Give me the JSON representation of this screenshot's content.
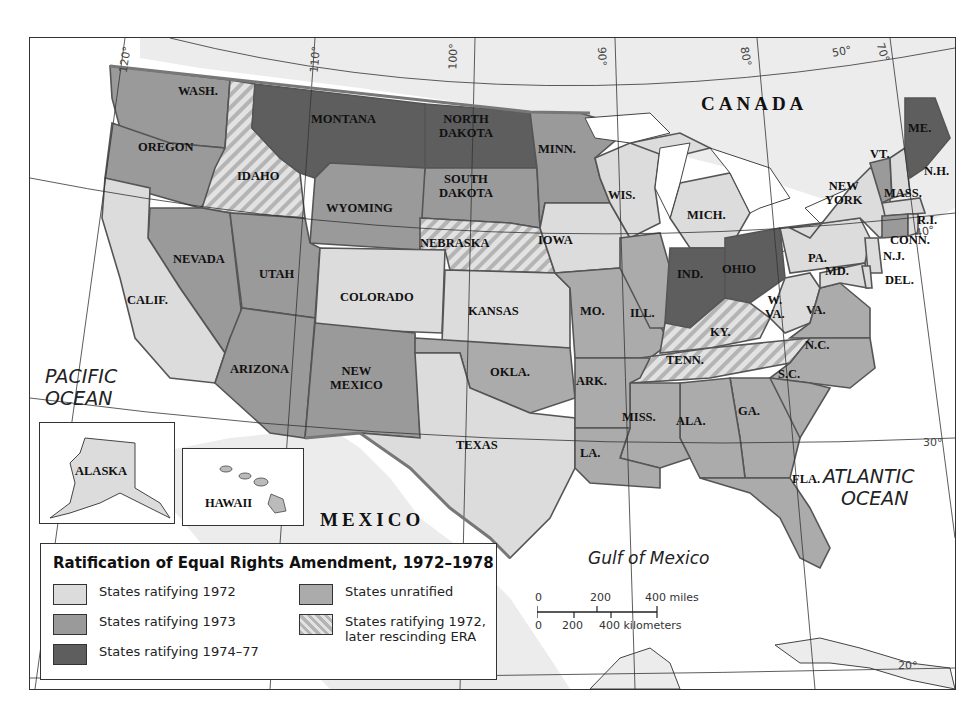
{
  "map": {
    "title": "Ratification of Equal Rights Amendment, 1972–1978",
    "colors": {
      "ratified_1972": "#dcdcdc",
      "ratified_1973": "#9a9a9a",
      "ratified_1974_77": "#5e5e5e",
      "unratified": "#ababab",
      "rescinded": "hatched #b4b4b4 / #e2e2e2",
      "water": "#ffffff",
      "land_foreign": "#ececec"
    },
    "regions": {
      "canada": "CANADA",
      "mexico": "MEXICO",
      "pacific": [
        "PACIFIC",
        "OCEAN"
      ],
      "atlantic": [
        "ATLANTIC",
        "OCEAN"
      ],
      "gulf": "Gulf of Mexico"
    },
    "graticule": [
      "120°",
      "110°",
      "100°",
      "90°",
      "80°",
      "70°",
      "50°",
      "40°",
      "30°",
      "20°"
    ],
    "states": {
      "wash": "WASH.",
      "oregon": "OREGON",
      "idaho": "IDAHO",
      "montana": "MONTANA",
      "north_dakota": [
        "NORTH",
        "DAKOTA"
      ],
      "south_dakota": [
        "SOUTH",
        "DAKOTA"
      ],
      "minn": "MINN.",
      "wyoming": "WYOMING",
      "nebraska": "NEBRASKA",
      "iowa": "IOWA",
      "wis": "WIS.",
      "mich": "MICH.",
      "nevada": "NEVADA",
      "utah": "UTAH",
      "colorado": "COLORADO",
      "calif": "CALIF.",
      "kansas": "KANSAS",
      "ill": "ILL.",
      "ind": "IND.",
      "ohio": "OHIO",
      "pa": "PA.",
      "new_york": [
        "NEW",
        "YORK"
      ],
      "vt": "VT.",
      "me": "ME.",
      "nh": "N.H.",
      "mass": "MASS.",
      "ri": "R.I.",
      "conn": "CONN.",
      "nj": "N.J.",
      "md": "MD.",
      "del": "DEL.",
      "wva": [
        "W.",
        "VA."
      ],
      "va": "VA.",
      "ky": "KY.",
      "mo": "MO.",
      "tenn": "TENN.",
      "nc": "N.C.",
      "sc": "S.C.",
      "arizona": "ARIZONA",
      "new_mexico": [
        "NEW",
        "MEXICO"
      ],
      "okla": "OKLA.",
      "ark": "ARK.",
      "miss": "MISS.",
      "ala": "ALA.",
      "ga": "GA.",
      "la": "LA.",
      "texas": "TEXAS",
      "fla": "FLA.",
      "alaska": "ALASKA",
      "hawaii": "HAWAII"
    },
    "legend": {
      "items": [
        {
          "label": "States ratifying 1972",
          "key": "ratified_1972"
        },
        {
          "label": "States ratifying 1973",
          "key": "ratified_1973"
        },
        {
          "label": "States ratifying 1974–77",
          "key": "ratified_1974_77"
        },
        {
          "label": "States unratified",
          "key": "unratified"
        },
        {
          "label": "States ratifying 1972, later rescinding ERA",
          "key": "rescinded"
        }
      ],
      "rescinded_lines": [
        "States ratifying 1972,",
        "later rescinding ERA"
      ]
    },
    "scale": {
      "miles_ticks": [
        "0",
        "200",
        "400 miles"
      ],
      "km_ticks": [
        "0",
        "200",
        "400 kilometers"
      ]
    }
  }
}
